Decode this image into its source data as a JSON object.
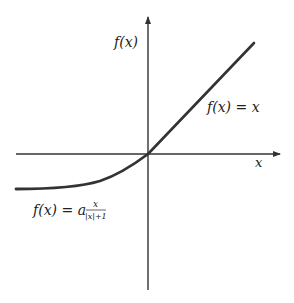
{
  "figure": {
    "colors": {
      "axis": "#333333",
      "curve": "#333333",
      "text": "#222222",
      "background": "#ffffff"
    },
    "axes": {
      "x_label": "x",
      "y_label": "f(x)",
      "origin_px": [
        148,
        154
      ],
      "x_axis_px": {
        "start": 16,
        "end": 280
      },
      "y_axis_px": {
        "top": 17,
        "bottom": 290
      }
    },
    "curves": [
      {
        "name": "identity",
        "label": "f(x) = x",
        "domain": "x >= 0",
        "start_px": [
          148,
          154
        ],
        "end_px": [
          254,
          43
        ]
      },
      {
        "name": "softsign",
        "label_prefix": "f(x) = a",
        "label_numerator": "x",
        "label_denominator": "|x|+1",
        "domain": "x <= 0",
        "start_px": [
          16,
          189
        ],
        "end_px": [
          148,
          154
        ]
      }
    ]
  }
}
